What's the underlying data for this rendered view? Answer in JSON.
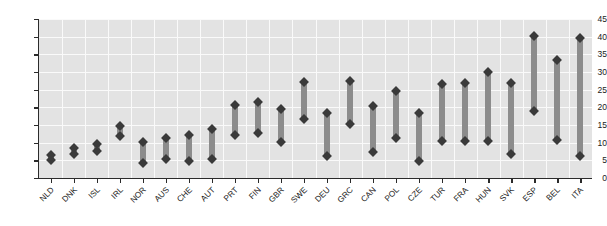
{
  "chart_data": {
    "type": "bar",
    "subtype": "range-bar-floating",
    "title": "",
    "subtitle": "",
    "xlabel": "",
    "ylabel": "",
    "ylim": [
      0,
      45
    ],
    "ytick_step": 5,
    "ytick_labels": [
      "0",
      "5",
      "10",
      "15",
      "20",
      "25",
      "30",
      "35",
      "40",
      "45"
    ],
    "ytick_values": [
      0,
      5,
      10,
      15,
      20,
      25,
      30,
      35,
      40,
      45
    ],
    "grid": true,
    "grid_color": "#fafafa",
    "panel_color": "#e3e3e3",
    "bar_color": "#8c8c8c",
    "marker_color": "#3a3a3a",
    "marker_shape": "diamond",
    "legend": null,
    "legend_position": "none",
    "categories": [
      "NLD",
      "DNK",
      "ISL",
      "IRL",
      "NOR",
      "AUS",
      "CHE",
      "AUT",
      "PRT",
      "FIN",
      "GBR",
      "SWE",
      "DEU",
      "GRC",
      "CAN",
      "POL",
      "CZE",
      "TUR",
      "FRA",
      "HUN",
      "SVK",
      "ESP",
      "BEL",
      "ITA"
    ],
    "series": [
      {
        "name": "low",
        "values": [
          5.0,
          6.8,
          7.7,
          11.8,
          4.2,
          5.3,
          4.8,
          5.4,
          12.1,
          12.7,
          10.2,
          16.7,
          6.2,
          15.2,
          7.3,
          11.4,
          4.9,
          10.4,
          10.6,
          10.6,
          6.9,
          19.0,
          10.8,
          6.2
        ]
      },
      {
        "name": "high",
        "values": [
          6.5,
          8.6,
          9.5,
          14.8,
          10.1,
          11.3,
          12.2,
          13.9,
          20.8,
          21.6,
          19.6,
          27.3,
          18.3,
          27.5,
          20.3,
          24.6,
          18.3,
          26.7,
          27.0,
          30.0,
          26.9,
          40.2,
          33.3,
          39.5
        ]
      }
    ]
  }
}
